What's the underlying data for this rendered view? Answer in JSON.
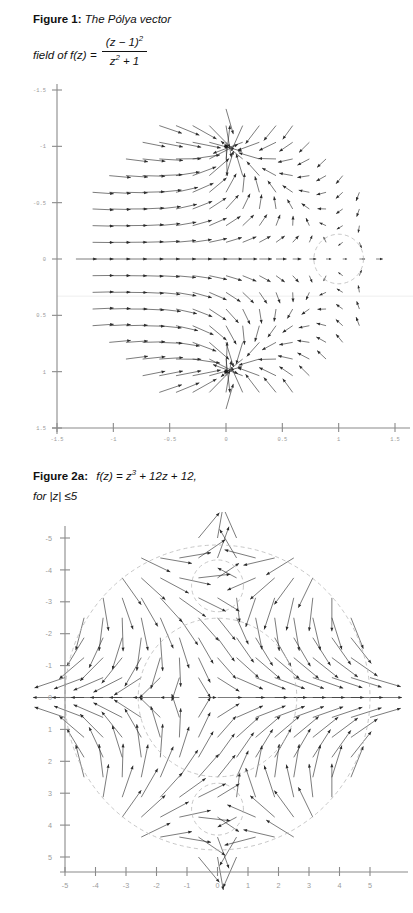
{
  "document": {
    "title": "Polya vector field figures"
  },
  "figure1": {
    "label": "Figure 1",
    "colon": ":",
    "caption_line1": "The Pólya vector",
    "caption_line2_prefix": "field of f(z)  =",
    "formula_numerator": "(z − 1)",
    "formula_numerator_exp": "2",
    "formula_denominator_base": "z",
    "formula_denominator_exp": "2",
    "formula_denominator_tail": " + 1",
    "xlabel": "",
    "ylabel": "",
    "x_ticks": [
      "-1.5",
      "-1",
      "-0.5",
      "0",
      "0.5",
      "1",
      "1.5"
    ],
    "y_ticks": [
      "1.5",
      "1",
      "0.5",
      "0",
      "-0.5",
      "-1",
      "-1.5"
    ],
    "xlim": [
      -1.5,
      1.5
    ],
    "ylim": [
      -1.5,
      1.5
    ],
    "accent_bar_color": "#1a1a1a",
    "arrow_color": "#2b2b2b",
    "axis_color": "#8a8a8a",
    "dashed_circle_color": "#b9b9b9",
    "annotations": {
      "sink_upper": "z = i",
      "sink_lower": "z = -i",
      "dashed_circle_center": "z = 1"
    }
  },
  "figure2a": {
    "label": "Figure 2a",
    "colon": ":",
    "caption_line1_prefix": "f(z) = z",
    "caption_line1_exp": "3",
    "caption_line1_tail": " + 12z + 12,",
    "caption_line2": "for |z| ≤5",
    "x_ticks": [
      "-5",
      "-4",
      "-3",
      "-2",
      "-1",
      "0",
      "1",
      "2",
      "3",
      "4",
      "5"
    ],
    "y_ticks": [
      "5",
      "4",
      "3",
      "2",
      "1",
      "0",
      "-1",
      "-2",
      "-3",
      "-4",
      "-5"
    ],
    "xlim": [
      -5.8,
      5.8
    ],
    "ylim": [
      -5.8,
      5.8
    ],
    "accent_bar_color": "#1a1a1a",
    "arrow_color": "#2b2b2b",
    "axis_color": "#8a8a8a",
    "dashed_circle_color": "#b9b9b9"
  },
  "chart_data": [
    {
      "type": "scatter",
      "name": "polya-vector-field-figure-1",
      "title": "Figure 1: The Pólya vector field of f(z) = (z-1)^2 / (z^2+1)",
      "field": "conjugate(f(z))",
      "function": "(z-1)^2/(z^2+1)",
      "xlabel": "",
      "ylabel": "",
      "xlim": [
        -1.5,
        1.5
      ],
      "ylim": [
        -1.5,
        1.5
      ],
      "x_ticks": [
        -1.5,
        -1,
        -0.5,
        0,
        0.5,
        1,
        1.5
      ],
      "y_ticks": [
        -1.5,
        -1,
        -0.5,
        0,
        0.5,
        1,
        1.5
      ],
      "grid": false,
      "legend": false,
      "sample_domain": "disk of radius 1.35 centered at origin",
      "sample_grid_step": 0.15,
      "markers": [
        {
          "label": "sink",
          "x": 0.0,
          "y": 1.0,
          "kind": "dot"
        },
        {
          "label": "sink",
          "x": 0.0,
          "y": -1.0,
          "kind": "dot"
        }
      ],
      "dashed_circles": [
        {
          "cx": 1.0,
          "cy": 0.0,
          "r": 0.22
        }
      ]
    },
    {
      "type": "scatter",
      "name": "polya-vector-field-figure-2a",
      "title": "Figure 2a: f(z) = z^3 + 12z + 12, for |z| <= 5",
      "field": "conjugate(f(z))",
      "function": "z^3+12z+12",
      "xlabel": "",
      "ylabel": "",
      "xlim": [
        -5.8,
        5.8
      ],
      "ylim": [
        -5.8,
        5.8
      ],
      "x_ticks": [
        -5,
        -4,
        -3,
        -2,
        -1,
        0,
        1,
        2,
        3,
        4,
        5
      ],
      "y_ticks": [
        -5,
        -4,
        -3,
        -2,
        -1,
        0,
        1,
        2,
        3,
        4,
        5
      ],
      "grid": false,
      "legend": false,
      "sample_domain": "disk |z| <= 5",
      "sample_grid_step": 0.62,
      "dashed_circles": [
        {
          "cx": 0.0,
          "cy": 0.0,
          "r": 5.0
        },
        {
          "cx": 0.0,
          "cy": 0.0,
          "r": 2.6
        },
        {
          "cx": 0.0,
          "cy": 3.5,
          "r": 0.85
        },
        {
          "cx": 0.0,
          "cy": -3.5,
          "r": 0.85
        }
      ]
    }
  ]
}
